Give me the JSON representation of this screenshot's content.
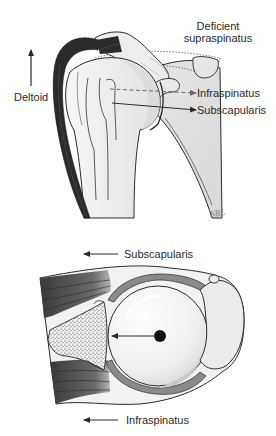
{
  "top_panel": {
    "labels": {
      "deficient_supraspinatus_line1": "Deficient",
      "deficient_supraspinatus_line2": "supraspinatus",
      "deltoid": "Deltoid",
      "infraspinatus": "Infraspinatus",
      "subscapularis": "Subscapularis"
    },
    "arrows": {
      "deltoid": "up",
      "infraspinatus": "right-dashed",
      "subscapularis": "right-solid"
    },
    "signature": "SBL"
  },
  "bottom_panel": {
    "labels": {
      "subscapularis": "Subscapularis",
      "infraspinatus": "Infraspinatus"
    },
    "arrows": {
      "subscapularis": "left",
      "infraspinatus": "left",
      "center_force": "left"
    }
  },
  "colors": {
    "deltoid_muscle": "#2b2b2b",
    "bone_fill": "#ececec",
    "outline": "#2a2a2a",
    "muscle_gradient_dark": "#3a3a3a",
    "muscle_gradient_light": "#9a9a9a",
    "cartilage": "#8a8a8a"
  }
}
